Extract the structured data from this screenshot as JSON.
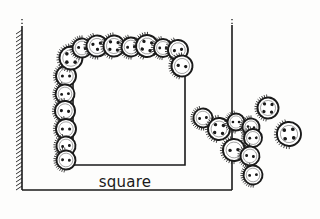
{
  "figure": {
    "title": "square",
    "label_text": "square",
    "colors": {
      "ink": "#1a1a1a",
      "paper": "#fdfdfc",
      "button_fill": "#ffffff",
      "hole_fill": "#1a1a1a",
      "shadow": "#2a2a2a"
    },
    "frame": {
      "name": "page-border",
      "left_edge_style": "hatched",
      "top_edge_style": "dotted",
      "x": 22,
      "y": 18,
      "width": 210,
      "height": 178
    },
    "inner_square": {
      "name": "square-outline",
      "x": 73,
      "y": 48,
      "width": 112,
      "height": 117,
      "stroke": 1.6
    }
  },
  "buttons": {
    "count_total": 29,
    "on_square_count": 16,
    "scattered_count": 13,
    "top_row": [
      {
        "cx": 71,
        "cy": 58,
        "r": 11.5,
        "holes": 4,
        "rot": 0
      },
      {
        "cx": 82,
        "cy": 48,
        "r": 9.5,
        "holes": 2,
        "rot": 10
      },
      {
        "cx": 97,
        "cy": 46,
        "r": 10.5,
        "holes": 3,
        "rot": -8
      },
      {
        "cx": 114,
        "cy": 46,
        "r": 10.5,
        "holes": 4,
        "rot": 5
      },
      {
        "cx": 131,
        "cy": 47,
        "r": 9.5,
        "holes": 2,
        "rot": -5
      },
      {
        "cx": 147,
        "cy": 46,
        "r": 11.0,
        "holes": 4,
        "rot": 12
      },
      {
        "cx": 163,
        "cy": 48,
        "r": 9.0,
        "holes": 2,
        "rot": 0
      },
      {
        "cx": 178,
        "cy": 50,
        "r": 10.0,
        "holes": 2,
        "rot": -10
      },
      {
        "cx": 182,
        "cy": 66,
        "r": 10.5,
        "holes": 2,
        "rot": 8
      }
    ],
    "left_column": [
      {
        "cx": 66,
        "cy": 76,
        "r": 10.0,
        "holes": 2,
        "rot": 0
      },
      {
        "cx": 65,
        "cy": 94,
        "r": 9.5,
        "holes": 2,
        "rot": -6
      },
      {
        "cx": 65,
        "cy": 111,
        "r": 10.0,
        "holes": 2,
        "rot": 6
      },
      {
        "cx": 66,
        "cy": 129,
        "r": 10.0,
        "holes": 2,
        "rot": 0
      },
      {
        "cx": 66,
        "cy": 146,
        "r": 9.5,
        "holes": 2,
        "rot": -8
      },
      {
        "cx": 66,
        "cy": 160,
        "r": 9.5,
        "holes": 2,
        "rot": 4
      }
    ],
    "scatter_cluster": [
      {
        "cx": 203,
        "cy": 118,
        "r": 9.5,
        "holes": 2,
        "rot": -8
      },
      {
        "cx": 219,
        "cy": 129,
        "r": 11.0,
        "holes": 4,
        "rot": 6
      },
      {
        "cx": 236,
        "cy": 122,
        "r": 8.5,
        "holes": 2,
        "rot": 0
      },
      {
        "cx": 234,
        "cy": 150,
        "r": 11.0,
        "holes": 2,
        "rot": -5
      },
      {
        "cx": 251,
        "cy": 127,
        "r": 8.5,
        "holes": 2,
        "rot": 10
      },
      {
        "cx": 253,
        "cy": 138,
        "r": 9.0,
        "holes": 2,
        "rot": -4
      },
      {
        "cx": 250,
        "cy": 156,
        "r": 9.5,
        "holes": 2,
        "rot": 8
      },
      {
        "cx": 253,
        "cy": 175,
        "r": 9.5,
        "holes": 2,
        "rot": -6
      },
      {
        "cx": 268,
        "cy": 108,
        "r": 10.5,
        "holes": 4,
        "rot": 4
      },
      {
        "cx": 289,
        "cy": 134,
        "r": 12.0,
        "holes": 4,
        "rot": -6
      }
    ]
  },
  "chart_data": {
    "type": "scatter",
    "title": "square",
    "xlabel": "",
    "ylabel": "",
    "series": [
      {
        "name": "buttons-on-square",
        "values": 16
      },
      {
        "name": "buttons-scattered",
        "values": 13
      }
    ]
  }
}
